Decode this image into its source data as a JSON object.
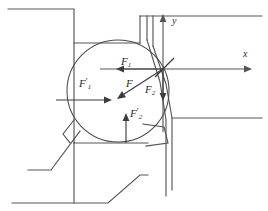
{
  "figure": {
    "kind": "engineering-mechanics-diagram",
    "background_color": "#ffffff",
    "line_color": "#565656",
    "label_color": "#2b2b2b"
  },
  "axes": {
    "origin": {
      "x": 163,
      "y": 69
    },
    "x_axis": {
      "label": "x",
      "from": {
        "x": 100,
        "y": 69
      },
      "to": {
        "x": 252,
        "y": 69
      },
      "direction": "right"
    },
    "y_axis": {
      "label": "y",
      "from": {
        "x": 163,
        "y": 130
      },
      "to": {
        "x": 163,
        "y": 14
      },
      "direction": "up"
    }
  },
  "forces": [
    {
      "name": "F1-reaction",
      "label": "F",
      "subscript": "1",
      "prime": false,
      "label_x": 122,
      "label_y": 60,
      "from": {
        "x": 163,
        "y": 69
      },
      "to": {
        "x": 117,
        "y": 69
      },
      "direction": "left",
      "description": "Horizontal force acting leftward at the contact origin"
    },
    {
      "name": "F-resultant",
      "label": "F",
      "subscript": "",
      "prime": false,
      "label_x": 125,
      "label_y": 83,
      "from": {
        "x": 163,
        "y": 69
      },
      "to": {
        "x": 118,
        "y": 98
      },
      "direction": "down-left",
      "description": "Resultant force directed down and to the left"
    },
    {
      "name": "F2-reaction",
      "label": "F",
      "subscript": "2",
      "prime": false,
      "label_x": 146,
      "label_y": 88,
      "from": {
        "x": 163,
        "y": 69
      },
      "to": {
        "x": 163,
        "y": 101
      },
      "direction": "down",
      "description": "Vertical force acting downward at the contact origin"
    },
    {
      "name": "F1-prime-applied",
      "label": "F",
      "subscript": "1",
      "prime": true,
      "label_x": 80,
      "label_y": 82,
      "from": {
        "x": 56,
        "y": 100
      },
      "to": {
        "x": 112,
        "y": 100
      },
      "direction": "right",
      "description": "Reaction force on the support acting rightward"
    },
    {
      "name": "F2-prime-applied",
      "label": "F",
      "subscript": "2",
      "prime": true,
      "label_x": 131,
      "label_y": 113,
      "from": {
        "x": 126,
        "y": 143
      },
      "to": {
        "x": 126,
        "y": 113
      },
      "direction": "up",
      "description": "Reaction force on the support acting upward"
    }
  ],
  "roller": {
    "name": "circular-roller",
    "center": {
      "x": 118,
      "y": 91
    },
    "radius": 51
  },
  "structure": {
    "description": "Two interlocking machine members forming a notched seat around the roller",
    "members": [
      "upper-left-block",
      "lower-left-block",
      "upper-right-block",
      "lower-right-block"
    ]
  }
}
